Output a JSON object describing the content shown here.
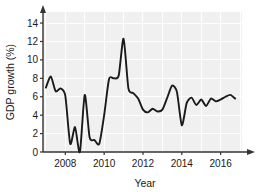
{
  "chart_data": {
    "type": "line",
    "title": "",
    "xlabel": "Year",
    "ylabel": "GDP growth (%)",
    "xlim": [
      2006.85,
      2017.1
    ],
    "ylim": [
      0,
      15.2
    ],
    "ytick_values": [
      0,
      2,
      4,
      6,
      8,
      10,
      12,
      14
    ],
    "ytick_labels": [
      "0",
      "2",
      "4",
      "6",
      "8",
      "10",
      "12",
      "14"
    ],
    "xtick_values": [
      2008,
      2010,
      2012,
      2014,
      2016
    ],
    "xtick_labels": [
      "2008",
      "2010",
      "2012",
      "2014",
      "2016"
    ],
    "grid": true,
    "grid_color": "#ffffff",
    "panel_color": "#f0f0f0",
    "line_color": "#1a1a1a",
    "legend": "none",
    "series": [
      {
        "name": "GDP growth (%)",
        "x": [
          2007.0,
          2007.25,
          2007.5,
          2007.75,
          2008.0,
          2008.25,
          2008.5,
          2008.75,
          2009.0,
          2009.25,
          2009.5,
          2009.75,
          2010.0,
          2010.25,
          2010.5,
          2010.75,
          2011.0,
          2011.25,
          2011.5,
          2011.75,
          2012.0,
          2012.25,
          2012.5,
          2012.75,
          2013.0,
          2013.25,
          2013.5,
          2013.75,
          2014.0,
          2014.25,
          2014.5,
          2014.75,
          2015.0,
          2015.25,
          2015.5,
          2015.75,
          2016.0,
          2016.25,
          2016.5,
          2016.75
        ],
        "values": [
          7.0,
          8.2,
          6.6,
          6.9,
          6.1,
          0.9,
          2.7,
          0.0,
          6.2,
          1.6,
          1.3,
          0.9,
          4.0,
          7.9,
          8.0,
          8.3,
          12.3,
          6.9,
          6.4,
          5.8,
          4.6,
          4.3,
          4.7,
          4.4,
          4.6,
          5.9,
          7.2,
          6.5,
          2.9,
          5.3,
          5.9,
          5.1,
          5.7,
          5.0,
          5.8,
          5.5,
          5.7,
          6.0,
          6.2,
          5.8
        ]
      }
    ]
  }
}
